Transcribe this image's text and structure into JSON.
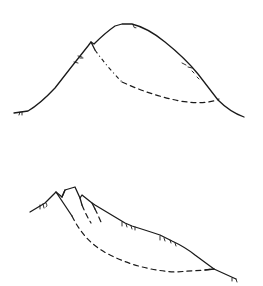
{
  "figures": [
    {
      "id": "top",
      "description": "Rounded hill profile with a single curved (rotational) slip surface shown dashed from the crest scarp to the right toe",
      "elements": [
        "ground-profile",
        "scarp",
        "slip-surface",
        "vegetation-tufts"
      ]
    },
    {
      "id": "bottom",
      "description": "Slope profile with multiple step scarps near the crest and nested curved slip surfaces shown dashed to the lower toe",
      "elements": [
        "ground-profile",
        "scarps",
        "slip-surfaces",
        "vegetation-tufts"
      ]
    }
  ],
  "colors": {
    "line": "#1a1a1a",
    "background": "#ffffff"
  }
}
